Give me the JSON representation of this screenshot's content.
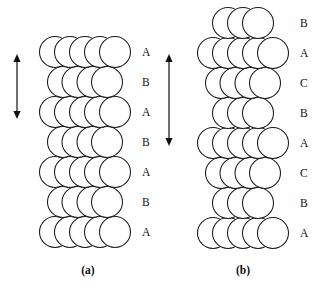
{
  "figure": {
    "background_color": "#ffffff",
    "sphere_fill": "#ffffff",
    "sphere_stroke": "#1a1a1a",
    "arrow_color": "#111111",
    "text_color": "#111111",
    "panels": [
      {
        "id": "panel-a",
        "caption": "(a)",
        "caption_x": 88,
        "caption_y": 274,
        "stacking_sequence": "ABABABA",
        "label_x": 142,
        "center_x": 85,
        "radius": 15.5,
        "row_pitch": 30,
        "layers": [
          {
            "label": "A",
            "y": 52,
            "type": "wide",
            "offsets": [
              -30,
              -15,
              0,
              15,
              30
            ]
          },
          {
            "label": "B",
            "y": 82,
            "type": "narrow",
            "offsets": [
              -22,
              -7.5,
              7.5,
              22
            ]
          },
          {
            "label": "A",
            "y": 112,
            "type": "wide",
            "offsets": [
              -30,
              -15,
              0,
              15,
              30
            ]
          },
          {
            "label": "B",
            "y": 142,
            "type": "narrow",
            "offsets": [
              -22,
              -7.5,
              7.5,
              22
            ]
          },
          {
            "label": "A",
            "y": 172,
            "type": "wide",
            "offsets": [
              -30,
              -15,
              0,
              15,
              30
            ]
          },
          {
            "label": "B",
            "y": 202,
            "type": "narrow",
            "offsets": [
              -22,
              -7.5,
              7.5,
              22
            ]
          },
          {
            "label": "A",
            "y": 232,
            "type": "wide",
            "offsets": [
              -30,
              -15,
              0,
              15,
              30
            ]
          }
        ],
        "arrow": {
          "name": "unit-cell-height-arrow-a",
          "x": 17,
          "y_top": 54,
          "y_bottom": 119,
          "double_headed": true
        }
      },
      {
        "id": "panel-b",
        "caption": "(b)",
        "caption_x": 243,
        "caption_y": 274,
        "stacking_sequence": "BACBACBA",
        "label_x": 300,
        "center_x": 243,
        "radius": 15.5,
        "row_pitch": 30,
        "layers": [
          {
            "label": "B",
            "y": 23,
            "type": "narrow",
            "offsets": [
              -15,
              0,
              15
            ]
          },
          {
            "label": "A",
            "y": 53,
            "type": "wide",
            "offsets": [
              -30,
              -15,
              0,
              15,
              30
            ]
          },
          {
            "label": "C",
            "y": 83,
            "type": "narrow",
            "offsets": [
              -22,
              -7.5,
              7.5,
              22
            ]
          },
          {
            "label": "B",
            "y": 113,
            "type": "narrow",
            "offsets": [
              -15,
              0,
              15
            ]
          },
          {
            "label": "A",
            "y": 143,
            "type": "wide",
            "offsets": [
              -30,
              -15,
              0,
              15,
              30
            ]
          },
          {
            "label": "C",
            "y": 173,
            "type": "narrow",
            "offsets": [
              -22,
              -7.5,
              7.5,
              22
            ]
          },
          {
            "label": "B",
            "y": 203,
            "type": "narrow",
            "offsets": [
              -15,
              0,
              15
            ]
          },
          {
            "label": "A",
            "y": 233,
            "type": "wide",
            "offsets": [
              -30,
              -15,
              0,
              15,
              30
            ]
          }
        ],
        "arrow": {
          "name": "unit-cell-height-arrow-b",
          "x": 169,
          "y_top": 54,
          "y_bottom": 146,
          "double_headed": true
        }
      }
    ]
  }
}
